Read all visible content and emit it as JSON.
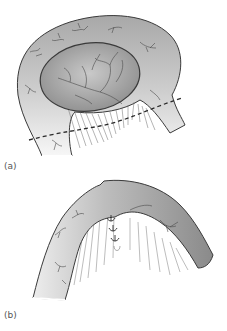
{
  "figure": {
    "panels": [
      {
        "label": "(a)",
        "description": "Bowel loop with mesentery; dashed line indicates line of resection through the mesentery below the oval lesion",
        "elements": [
          "outer-bowel-loop",
          "inner-oval-lesion",
          "blood-vessels",
          "mesentery-lines",
          "dashed-resection-line"
        ]
      },
      {
        "label": "(b)",
        "description": "Bowel after closure; arched segment with mesenteric defect closed by interrupted sutures",
        "elements": [
          "arched-bowel-segment",
          "blood-vessels",
          "mesentery-lines",
          "sutures"
        ]
      }
    ],
    "colors": {
      "outline": "#3a3a3a",
      "fill_dark": "#9a9a9a",
      "fill_light": "#f2f2f2",
      "vessel": "#4a4a4a",
      "background": "#ffffff"
    }
  }
}
